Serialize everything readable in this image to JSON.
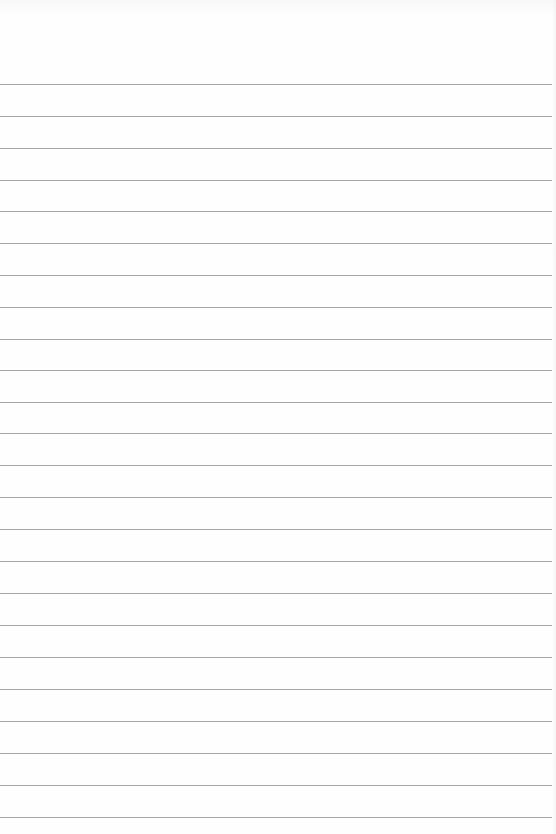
{
  "document": {
    "type": "lined-paper",
    "rule_color": "#a6a6a6",
    "background_color": "#fefefe",
    "rule_count": 24,
    "rules_y": [
      84,
      116,
      148,
      180,
      211,
      243,
      275,
      307,
      339,
      370,
      402,
      433,
      465,
      497,
      529,
      561,
      593,
      625,
      657,
      689,
      721,
      753,
      785,
      817
    ]
  }
}
